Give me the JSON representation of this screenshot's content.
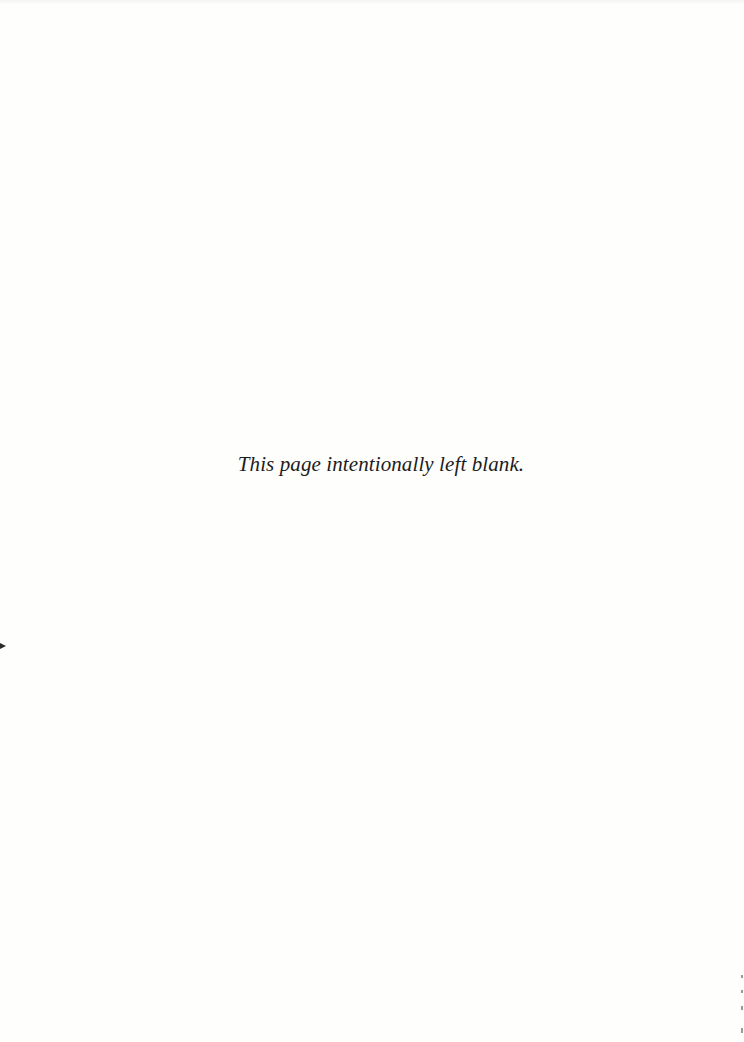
{
  "page": {
    "notice_text": "This page intentionally left blank."
  }
}
